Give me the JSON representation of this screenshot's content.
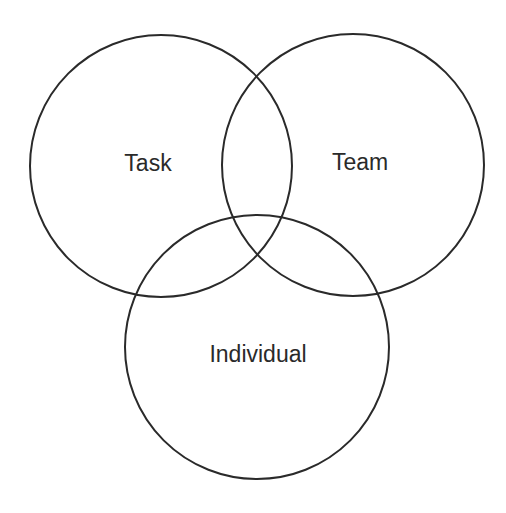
{
  "diagram": {
    "type": "venn",
    "stroke_color": "#2a2a2a",
    "background": "#ffffff",
    "sets": [
      {
        "id": "task",
        "label": "Task",
        "cx": 161,
        "cy": 166,
        "r": 131,
        "label_x": 148,
        "label_y": 171
      },
      {
        "id": "team",
        "label": "Team",
        "cx": 353,
        "cy": 165,
        "r": 131,
        "label_x": 360,
        "label_y": 170
      },
      {
        "id": "individual",
        "label": "Individual",
        "cx": 257,
        "cy": 347,
        "r": 132,
        "label_x": 258,
        "label_y": 362
      }
    ]
  }
}
